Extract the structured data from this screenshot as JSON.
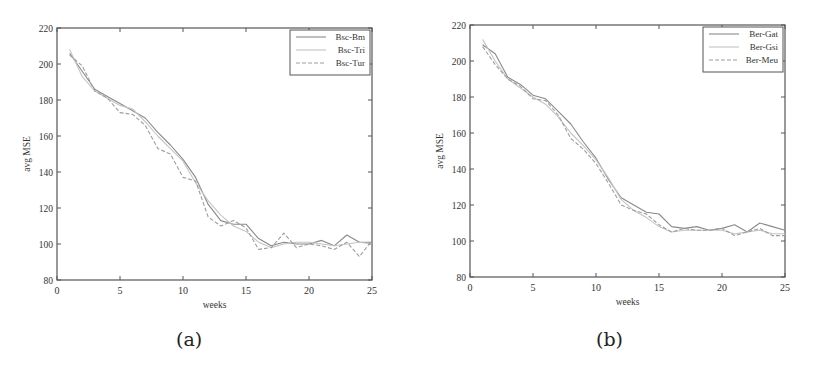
{
  "figure": {
    "captions": [
      "(a)",
      "(b)"
    ]
  },
  "chart_data": [
    {
      "type": "line",
      "panel": "(a)",
      "title": "",
      "xlabel": "weeks",
      "ylabel": "avg MSE",
      "xlim": [
        0,
        25
      ],
      "ylim": [
        80,
        220
      ],
      "xticks": [
        0,
        5,
        10,
        15,
        20,
        25
      ],
      "yticks": [
        80,
        100,
        120,
        140,
        160,
        180,
        200,
        220
      ],
      "grid": false,
      "legend_position": "upper right",
      "x": [
        1,
        2,
        3,
        4,
        5,
        6,
        7,
        8,
        9,
        10,
        11,
        12,
        13,
        14,
        15,
        16,
        17,
        18,
        19,
        20,
        21,
        22,
        23,
        24,
        25
      ],
      "series": [
        {
          "name": "Bsc-Bm",
          "color": "#8a8a8a",
          "dash": "",
          "values": [
            206,
            196,
            186,
            182,
            178,
            174,
            170,
            162,
            155,
            147,
            137,
            122,
            113,
            111,
            111,
            103,
            99,
            101,
            100,
            100,
            102,
            99,
            105,
            101,
            101
          ]
        },
        {
          "name": "Bsc-Tri",
          "color": "#c4c4c4",
          "dash": "",
          "values": [
            208,
            193,
            185,
            181,
            177,
            175,
            168,
            160,
            153,
            146,
            134,
            124,
            116,
            110,
            107,
            101,
            98,
            100,
            101,
            101,
            100,
            99,
            100,
            101,
            100
          ]
        },
        {
          "name": "Bsc-Tur",
          "color": "#9e9e9e",
          "dash": "4,2",
          "values": [
            205,
            199,
            185,
            181,
            173,
            172,
            166,
            153,
            150,
            137,
            135,
            115,
            110,
            113,
            109,
            97,
            98,
            106,
            98,
            100,
            99,
            97,
            101,
            93,
            102
          ]
        }
      ]
    },
    {
      "type": "line",
      "panel": "(b)",
      "title": "",
      "xlabel": "weeks",
      "ylabel": "avg MSE",
      "xlim": [
        0,
        25
      ],
      "ylim": [
        80,
        220
      ],
      "xticks": [
        0,
        5,
        10,
        15,
        20,
        25
      ],
      "yticks": [
        80,
        100,
        120,
        140,
        160,
        180,
        200,
        220
      ],
      "grid": false,
      "legend_position": "upper right",
      "x": [
        1,
        2,
        3,
        4,
        5,
        6,
        7,
        8,
        9,
        10,
        11,
        12,
        13,
        14,
        15,
        16,
        17,
        18,
        19,
        20,
        21,
        22,
        23,
        24,
        25
      ],
      "series": [
        {
          "name": "Ber-Gat",
          "color": "#8a8a8a",
          "dash": "",
          "values": [
            209,
            204,
            191,
            187,
            181,
            179,
            172,
            165,
            155,
            146,
            134,
            124,
            120,
            116,
            115,
            108,
            107,
            108,
            106,
            107,
            109,
            105,
            110,
            108,
            106
          ]
        },
        {
          "name": "Ber-Gsi",
          "color": "#c4c4c4",
          "dash": "",
          "values": [
            212,
            200,
            190,
            185,
            180,
            176,
            169,
            160,
            153,
            145,
            135,
            123,
            117,
            113,
            108,
            105,
            106,
            106,
            106,
            106,
            104,
            105,
            106,
            104,
            104
          ]
        },
        {
          "name": "Ber-Meu",
          "color": "#9e9e9e",
          "dash": "4,2",
          "values": [
            208,
            198,
            190,
            186,
            179,
            178,
            170,
            157,
            151,
            143,
            132,
            120,
            117,
            115,
            109,
            105,
            107,
            106,
            106,
            107,
            103,
            105,
            107,
            103,
            103
          ]
        }
      ]
    }
  ]
}
